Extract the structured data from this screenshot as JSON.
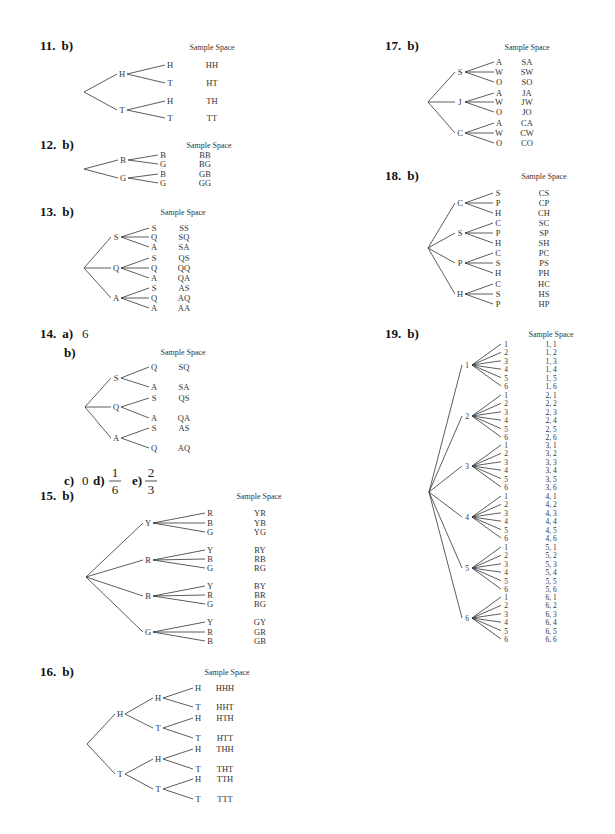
{
  "sample_space_header": "Sample Space",
  "problems": [
    {
      "id": "p11",
      "number": "11.",
      "part": "b)",
      "levels": [
        [
          "H",
          "T"
        ],
        [
          "H",
          "T"
        ]
      ],
      "outcomes": [
        "HH",
        "HT",
        "TH",
        "TT"
      ]
    },
    {
      "id": "p12",
      "number": "12.",
      "part": "b)",
      "levels": [
        [
          "B",
          "G"
        ],
        [
          "B",
          "G"
        ]
      ],
      "outcomes": [
        "BB",
        "BG",
        "GB",
        "GG"
      ]
    },
    {
      "id": "p13",
      "number": "13.",
      "part": "b)",
      "levels": [
        [
          "S",
          "Q",
          "A"
        ],
        [
          "S",
          "Q",
          "A"
        ]
      ],
      "outcomes": [
        "SS",
        "SQ",
        "SA",
        "QS",
        "QQ",
        "QA",
        "AS",
        "AQ",
        "AA"
      ]
    },
    {
      "id": "p14",
      "number": "14.",
      "parts": {
        "a_label": "a)",
        "a_value": "6",
        "b_label": "b)",
        "c_label": "c)",
        "c_value": "0",
        "d_label": "d)",
        "d_num": "1",
        "d_den": "6",
        "e_label": "e)",
        "e_num": "2",
        "e_den": "3"
      },
      "first_level": [
        "S",
        "Q",
        "A"
      ],
      "second_level": [
        [
          "Q",
          "A"
        ],
        [
          "S",
          "A"
        ],
        [
          "S",
          "Q"
        ]
      ],
      "outcomes": [
        "SQ",
        "SA",
        "QS",
        "QA",
        "AS",
        "AQ"
      ]
    },
    {
      "id": "p15",
      "number": "15.",
      "part": "b)",
      "first_level": [
        "Y",
        "R",
        "B",
        "G"
      ],
      "second_level": [
        [
          "R",
          "B",
          "G"
        ],
        [
          "Y",
          "B",
          "G"
        ],
        [
          "Y",
          "R",
          "G"
        ],
        [
          "Y",
          "R",
          "B"
        ]
      ],
      "outcomes": [
        "YR",
        "YB",
        "YG",
        "RY",
        "RB",
        "RG",
        "BY",
        "BR",
        "BG",
        "GY",
        "GR",
        "GB"
      ]
    },
    {
      "id": "p16",
      "number": "16.",
      "part": "b)",
      "levels": [
        [
          "H",
          "T"
        ],
        [
          "H",
          "T"
        ],
        [
          "H",
          "T"
        ]
      ],
      "outcomes": [
        "HHH",
        "HHT",
        "HTH",
        "HTT",
        "THH",
        "THT",
        "TTH",
        "TTT"
      ]
    },
    {
      "id": "p17",
      "number": "17.",
      "part": "b)",
      "levels": [
        [
          "S",
          "J",
          "C"
        ],
        [
          "A",
          "W",
          "O"
        ]
      ],
      "outcomes": [
        "SA",
        "SW",
        "SO",
        "JA",
        "JW",
        "JO",
        "CA",
        "CW",
        "CO"
      ]
    },
    {
      "id": "p18",
      "number": "18.",
      "part": "b)",
      "first_level": [
        "C",
        "S",
        "P",
        "H"
      ],
      "second_level": [
        [
          "S",
          "P",
          "H"
        ],
        [
          "C",
          "P",
          "H"
        ],
        [
          "C",
          "S",
          "H"
        ],
        [
          "C",
          "S",
          "P"
        ]
      ],
      "outcomes": [
        "CS",
        "CP",
        "CH",
        "SC",
        "SP",
        "SH",
        "PC",
        "PS",
        "PH",
        "HC",
        "HS",
        "HP"
      ]
    },
    {
      "id": "p19",
      "number": "19.",
      "part": "b)",
      "levels": [
        [
          "1",
          "2",
          "3",
          "4",
          "5",
          "6"
        ],
        [
          "1",
          "2",
          "3",
          "4",
          "5",
          "6"
        ]
      ],
      "outcomes": [
        "1, 1",
        "1, 2",
        "1, 3",
        "1, 4",
        "1, 5",
        "1, 6",
        "2, 1",
        "2, 2",
        "2, 3",
        "2, 4",
        "2, 5",
        "2, 6",
        "3, 1",
        "3, 2",
        "3, 3",
        "3, 4",
        "3, 5",
        "3, 6",
        "4, 1",
        "4, 2",
        "4, 3",
        "4, 4",
        "4, 5",
        "4, 6",
        "5, 1",
        "5, 2",
        "5, 3",
        "5, 4",
        "5, 5",
        "5, 6",
        "6, 1",
        "6, 2",
        "6, 3",
        "6, 4",
        "6, 5",
        "6, 6"
      ]
    }
  ]
}
